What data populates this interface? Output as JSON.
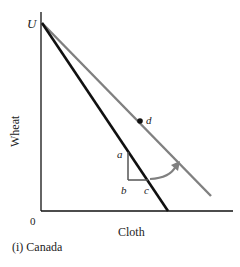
{
  "diagram": {
    "panel_caption": "(i) Canada",
    "x_axis_label": "Cloth",
    "y_axis_label": "Wheat",
    "origin_label": "0",
    "intercept_label": "U",
    "points": {
      "a": "a",
      "b": "b",
      "c": "c",
      "d": "d"
    },
    "colors": {
      "axis": "#111111",
      "ppf_line": "#111111",
      "trade_line": "#808080",
      "triangle": "#555555",
      "arrow": "#808080"
    }
  }
}
